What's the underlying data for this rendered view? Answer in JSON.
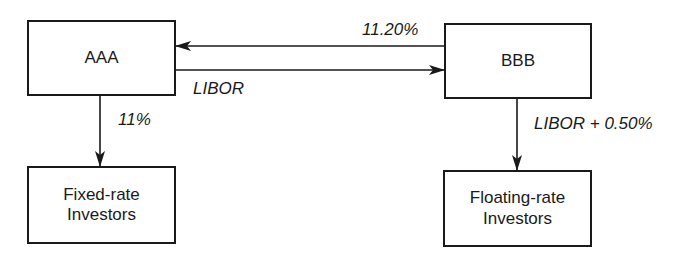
{
  "diagram": {
    "type": "interest-rate-swap-flow",
    "nodes": {
      "aaa": {
        "label": "AAA"
      },
      "bbb": {
        "label": "BBB"
      },
      "fixed_investors": {
        "label": "Fixed-rate\nInvestors"
      },
      "floating_investors": {
        "label": "Floating-rate\nInvestors"
      }
    },
    "edges": [
      {
        "id": "bbb_to_aaa",
        "from": "BBB",
        "to": "AAA",
        "label": "11.20%"
      },
      {
        "id": "aaa_to_bbb",
        "from": "AAA",
        "to": "BBB",
        "label": "LIBOR"
      },
      {
        "id": "aaa_to_fixed",
        "from": "AAA",
        "to": "Fixed-rate Investors",
        "label": "11%"
      },
      {
        "id": "bbb_to_floating",
        "from": "BBB",
        "to": "Floating-rate Investors",
        "label": "LIBOR + 0.50%"
      }
    ],
    "edge_labels": {
      "bbb_to_aaa": "11.20%",
      "aaa_to_bbb": "LIBOR",
      "aaa_to_fixed": "11%",
      "bbb_to_floating": "LIBOR + 0.50%"
    },
    "colors": {
      "stroke": "#1a1a1a",
      "background": "#ffffff"
    }
  }
}
